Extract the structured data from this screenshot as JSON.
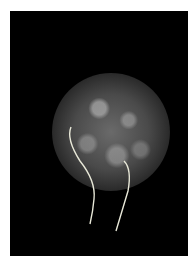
{
  "image": {
    "description": "Grayscale fluorescence micrograph of a round cell with textured surface and two flagella on a black background",
    "background_color": "#000000",
    "border_color": "#ffffff",
    "subject": "cell",
    "features": [
      "textured-cell-body",
      "flagellum-left",
      "flagellum-right"
    ]
  }
}
